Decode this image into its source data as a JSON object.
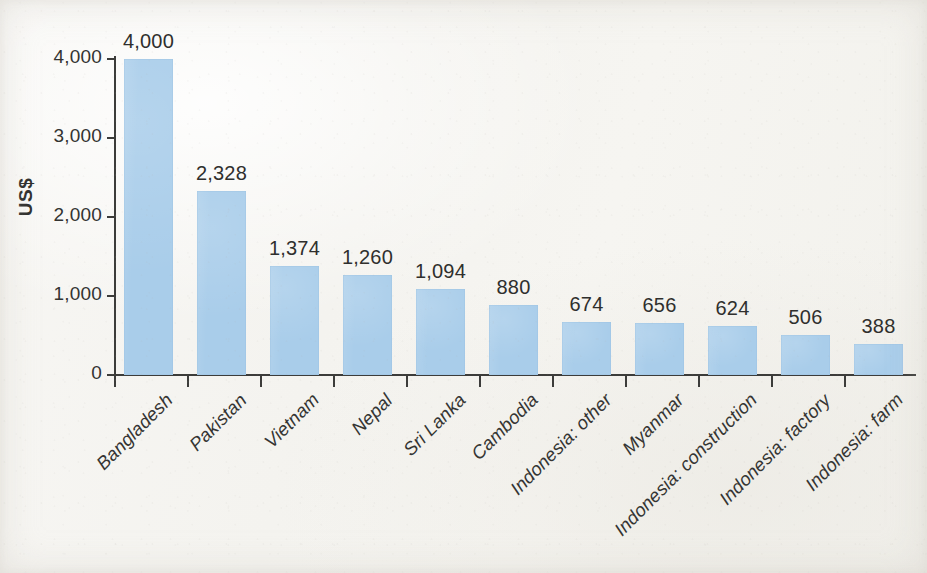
{
  "chart_data": {
    "type": "bar",
    "title": "",
    "subtitle": "",
    "xlabel": "",
    "ylabel": "US$",
    "ylim": [
      0,
      4000
    ],
    "ytick_values": [
      0,
      1000,
      2000,
      3000,
      4000
    ],
    "ytick_labels": [
      "0",
      "1,000",
      "2,000",
      "3,000",
      "4,000"
    ],
    "grid": false,
    "legend": null,
    "bar_color": "#a9cdea",
    "axis_color": "#3c3c3a",
    "text_color": "#2f2f2d",
    "background_color": "#f6f5f2",
    "categories": [
      "Bangladesh",
      "Pakistan",
      "Vietnam",
      "Nepal",
      "Sri Lanka",
      "Cambodia",
      "Indonesia: other",
      "Myanmar",
      "Indonesia: construction",
      "Indonesia: factory",
      "Indonesia: farm"
    ],
    "values": [
      4000,
      2328,
      1374,
      1260,
      1094,
      880,
      674,
      656,
      624,
      506,
      388
    ],
    "value_labels": [
      "4,000",
      "2,328",
      "1,374",
      "1,260",
      "1,094",
      "880",
      "674",
      "656",
      "624",
      "506",
      "388"
    ],
    "series": [
      {
        "name": "US$",
        "values": [
          4000,
          2328,
          1374,
          1260,
          1094,
          880,
          674,
          656,
          624,
          506,
          388
        ]
      }
    ]
  }
}
